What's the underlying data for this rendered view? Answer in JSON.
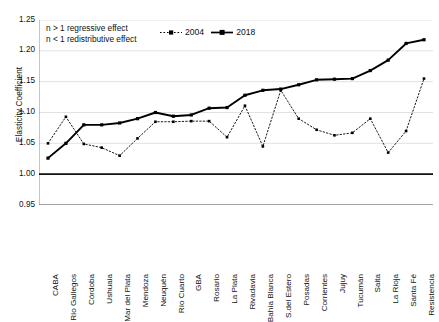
{
  "chart_data": {
    "type": "line",
    "title": "",
    "xlabel": "",
    "ylabel": "Elasticity Coefficient",
    "ylim": [
      0.95,
      1.25
    ],
    "yticks": [
      "1.25",
      "1.20",
      "1.15",
      "1.10",
      "1.05",
      "1.00",
      "0.95"
    ],
    "ytick_values": [
      1.25,
      1.2,
      1.15,
      1.1,
      1.05,
      1.0,
      0.95
    ],
    "grid": true,
    "legend_position": "top-center",
    "reference_line": 1.0,
    "categories": [
      "CABA",
      "Río Gallegos",
      "Córdoba",
      "Ushuaia",
      "Mar del Plata",
      "Mendoza",
      "Neuquén",
      "Río Cuarto",
      "GBA",
      "Rosario",
      "La Plata",
      "Rivadavia",
      "Bahía Blanca",
      "S.del Estero",
      "Posadas",
      "Corrientes",
      "Jujuy",
      "Tucumán",
      "Salta",
      "La Rioja",
      "Santa Fé",
      "Resistencia"
    ],
    "series": [
      {
        "name": "2004",
        "style": "dotted",
        "marker": "square",
        "color": "#000000",
        "values": [
          1.05,
          1.093,
          1.049,
          1.043,
          1.03,
          1.058,
          1.085,
          1.085,
          1.086,
          1.086,
          1.06,
          1.111,
          1.045,
          1.136,
          1.09,
          1.072,
          1.063,
          1.067,
          1.09,
          1.035,
          1.07,
          1.155
        ]
      },
      {
        "name": "2018",
        "style": "solid",
        "marker": "square",
        "color": "#000000",
        "values": [
          1.026,
          1.05,
          1.08,
          1.08,
          1.083,
          1.09,
          1.1,
          1.094,
          1.096,
          1.107,
          1.108,
          1.128,
          1.136,
          1.138,
          1.145,
          1.153,
          1.154,
          1.155,
          1.168,
          1.185,
          1.212,
          1.218
        ]
      }
    ],
    "annotations": [
      "n > 1 regressive effect",
      "n < 1 redistributive effect"
    ]
  },
  "legend": {
    "items": [
      {
        "label": "2004"
      },
      {
        "label": "2018"
      }
    ]
  }
}
